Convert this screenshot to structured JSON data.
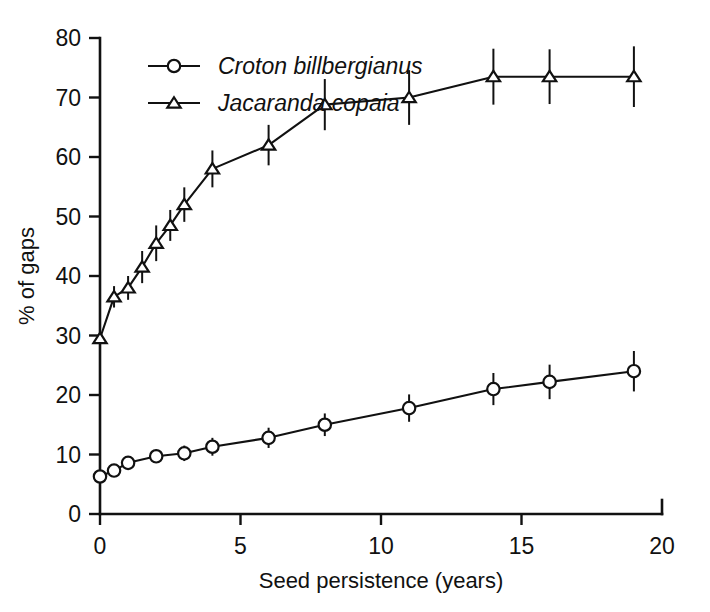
{
  "chart_data": {
    "type": "line",
    "title": "",
    "xlabel": "Seed persistence (years)",
    "ylabel": "% of gaps",
    "xlim": [
      0,
      20
    ],
    "ylim": [
      0,
      80
    ],
    "xticks": [
      0,
      5,
      10,
      15,
      20
    ],
    "yticks": [
      0,
      10,
      20,
      30,
      40,
      50,
      60,
      70,
      80
    ],
    "xtick_labels": [
      "0",
      "5",
      "10",
      "15",
      "20"
    ],
    "ytick_labels": [
      "0",
      "10",
      "20",
      "30",
      "40",
      "50",
      "60",
      "70",
      "80"
    ],
    "grid": false,
    "legend_position": "top-left",
    "error_bars": "vertical",
    "marker_style": [
      "open-circle",
      "open-triangle"
    ],
    "series": [
      {
        "name": "Croton billbergianus",
        "marker": "open-circle",
        "color": "#111111",
        "x": [
          0,
          0.5,
          1,
          2,
          3,
          4,
          6,
          8,
          11,
          14,
          16,
          19
        ],
        "values": [
          6.3,
          7.3,
          8.6,
          9.7,
          10.2,
          11.3,
          12.8,
          15.0,
          17.8,
          21.0,
          22.2,
          24.0
        ],
        "yerr": [
          0.0,
          0.8,
          0.9,
          1.1,
          1.3,
          1.5,
          1.7,
          1.9,
          2.3,
          2.7,
          2.9,
          3.4
        ]
      },
      {
        "name": "Jacaranda copaia",
        "marker": "open-triangle",
        "color": "#111111",
        "x": [
          0,
          0.5,
          1,
          1.5,
          2,
          2.5,
          3,
          4,
          6,
          8,
          11,
          14,
          16,
          19
        ],
        "values": [
          29.5,
          36.5,
          38.0,
          41.5,
          45.5,
          48.5,
          52.0,
          58.0,
          62.0,
          68.8,
          70.0,
          73.5,
          73.5,
          73.5
        ],
        "yerr": [
          0.8,
          1.8,
          2.0,
          2.7,
          3.0,
          2.6,
          2.9,
          3.1,
          3.4,
          4.3,
          4.6,
          4.7,
          4.6,
          5.1
        ]
      }
    ]
  },
  "axes": {
    "y_axis_label": "% of gaps",
    "x_axis_label": "Seed persistence (years)"
  },
  "legend": {
    "entries": [
      {
        "label": "Croton billbergianus",
        "marker": "open-circle"
      },
      {
        "label": "Jacaranda copaia",
        "marker": "open-triangle"
      }
    ]
  }
}
